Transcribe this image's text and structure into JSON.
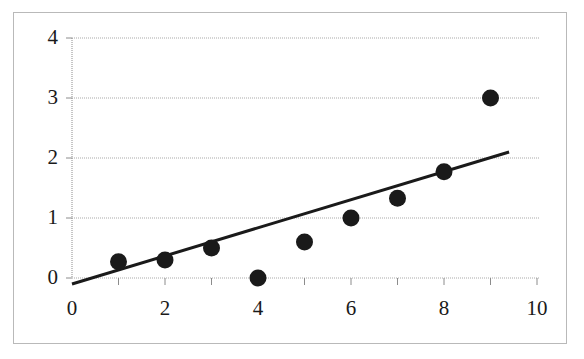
{
  "chart_data": {
    "type": "scatter",
    "title": "",
    "subtitle": "",
    "xlabel": "",
    "ylabel": "",
    "xlim": [
      0,
      10
    ],
    "ylim": [
      0,
      4
    ],
    "grid": true,
    "legend": null,
    "x_ticks": [
      0,
      2,
      4,
      6,
      8,
      10
    ],
    "x_tick_labels": [
      "0",
      "2",
      "4",
      "6",
      "8",
      "10"
    ],
    "x_minor_ticks": [
      1,
      3,
      5,
      7,
      9
    ],
    "y_ticks": [
      0,
      1,
      2,
      3,
      4
    ],
    "y_tick_labels": [
      "0",
      "1",
      "2",
      "3",
      "4"
    ],
    "series": [
      {
        "name": "data-points",
        "type": "scatter",
        "marker": "filled-circle",
        "marker_color": "#1a1a1a",
        "marker_size": 17,
        "x": [
          1,
          2,
          3,
          4,
          5,
          6,
          7,
          8,
          9
        ],
        "y": [
          0.27,
          0.3,
          0.5,
          0.0,
          0.6,
          1.0,
          1.33,
          1.77,
          3.0
        ]
      },
      {
        "name": "trendline",
        "type": "line",
        "line_color": "#1a1a1a",
        "line_width": 3,
        "x": [
          0,
          9.4
        ],
        "y": [
          -0.1,
          2.1
        ]
      }
    ]
  },
  "axes": {
    "axis_color": "#8c8c8c",
    "gridline_color": "#a9a9a9",
    "tick_color": "#8c8c8c",
    "frame_color": "#b9b9b9",
    "plot_background": "#ffffff"
  }
}
